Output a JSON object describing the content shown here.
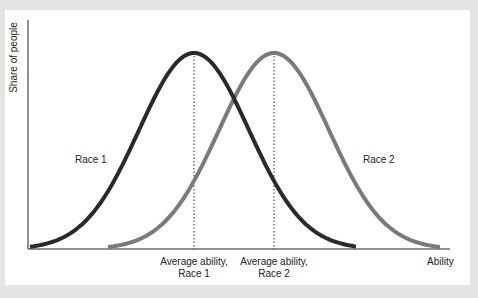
{
  "chart_data": {
    "type": "line",
    "title": "",
    "xlabel": "Ability",
    "ylabel": "Share of people",
    "grid": false,
    "legend": "inline labels",
    "series": [
      {
        "name": "Race 1",
        "color": "#2a2a2a",
        "mean_label": "Average ability, Race 1",
        "shape": "normal curve",
        "peak_x_px": 194
      },
      {
        "name": "Race 2",
        "color": "#7a7a7a",
        "mean_label": "Average ability, Race 2",
        "shape": "normal curve",
        "peak_x_px": 274
      }
    ],
    "annotations": [
      "Average ability, Race 1",
      "Average ability, Race 2"
    ]
  },
  "labels": {
    "ylabel": "Share of people",
    "xlabel": "Ability",
    "race1": "Race 1",
    "race2": "Race 2",
    "avg1_line1": "Average ability,",
    "avg1_line2": "Race 1",
    "avg2_line1": "Average ability,",
    "avg2_line2": "Race 2"
  }
}
